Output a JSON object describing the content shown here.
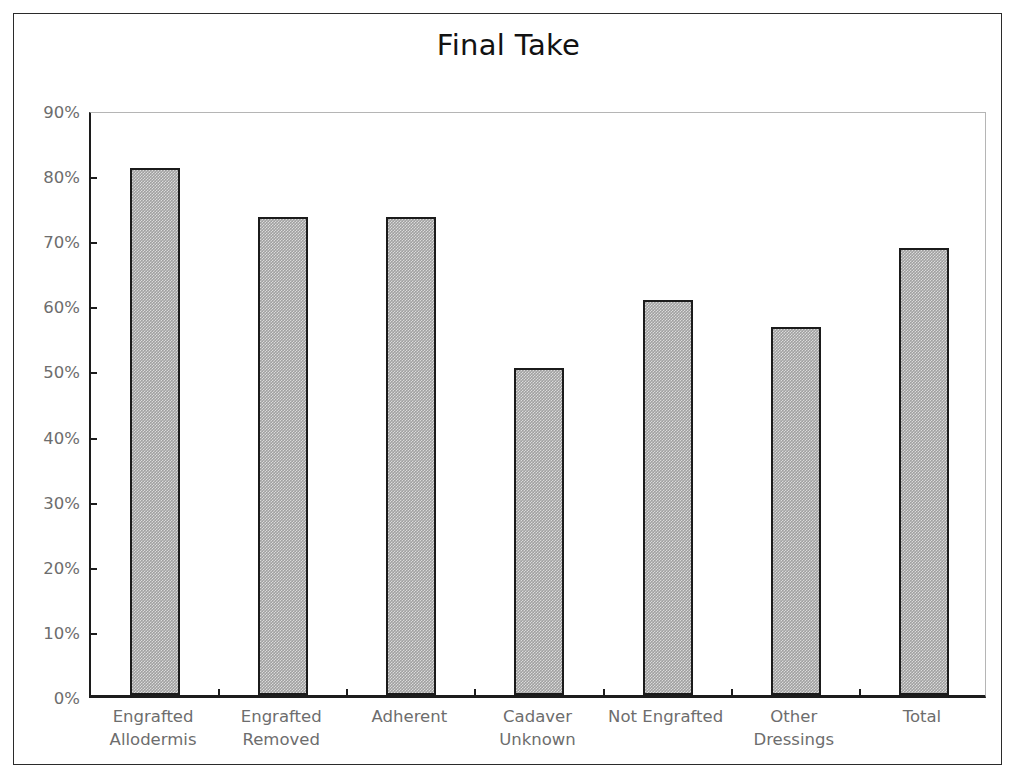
{
  "chart_data": {
    "type": "bar",
    "title": "Final Take",
    "xlabel": "",
    "ylabel": "",
    "categories": [
      "Engrafted Allodermis",
      "Engrafted Removed",
      "Adherent",
      "Cadaver Unknown",
      "Not Engrafted",
      "Other Dressings",
      "Total"
    ],
    "category_lines": [
      [
        "Engrafted",
        "Allodermis"
      ],
      [
        "Engrafted",
        "Removed"
      ],
      [
        "Adherent",
        ""
      ],
      [
        "Cadaver",
        "Unknown"
      ],
      [
        "Not Engrafted",
        ""
      ],
      [
        "Other",
        "Dressings"
      ],
      [
        "Total",
        ""
      ]
    ],
    "values": [
      81,
      73.4,
      73.4,
      50.3,
      60.6,
      56.5,
      68.7
    ],
    "value_unit": "%",
    "ylim": [
      0,
      90
    ],
    "ytick_values": [
      0,
      10,
      20,
      30,
      40,
      50,
      60,
      70,
      80,
      90
    ],
    "ytick_labels": [
      "0%",
      "10%",
      "20%",
      "30%",
      "40%",
      "50%",
      "60%",
      "70%",
      "80%",
      "90%"
    ],
    "grid": false,
    "legend": false,
    "series": [
      {
        "name": "Final Take",
        "values": [
          81,
          73.4,
          73.4,
          50.3,
          60.6,
          56.5,
          68.7
        ]
      }
    ],
    "colors": {
      "bar_fill": "#a0a0a0",
      "bar_border": "#1b1b1b",
      "axis": "#1c1c1c",
      "plot_border": "#b5b5b5",
      "frame_border": "#2b2b2b",
      "tick_label": "#6d6d6d",
      "title": "#121212",
      "background": "#ffffff"
    }
  }
}
